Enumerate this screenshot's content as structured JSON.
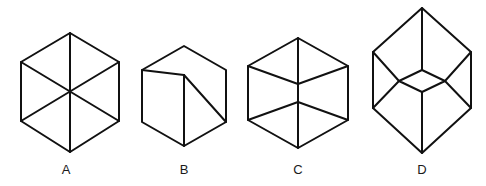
{
  "figure": {
    "type": "line-drawing-multiple-choice",
    "background_color": "#ffffff",
    "stroke_color": "#111111",
    "stroke_width": 2,
    "label_color": "#1a1a1a",
    "canvas": {
      "width": 486,
      "height": 186
    },
    "options": [
      {
        "id": "A",
        "label": "A",
        "name": "hexagon-with-three-full-diagonals",
        "label_x": 66,
        "label_y": 174,
        "outline_points": "70,33 119,62 119,121 70,152 21,121 21,62",
        "inner_lines": [
          "70,33 70,152",
          "21,62 119,121",
          "119,62 21,121"
        ],
        "center": {
          "x": 70,
          "y": 92
        }
      },
      {
        "id": "B",
        "label": "B",
        "name": "cube-inner-vertex-lower-left",
        "label_x": 184,
        "label_y": 174,
        "outline_points": "184,46 226,70 226,122 184,146 142,122 142,70",
        "inner_lines": [
          "184,75 184,146",
          "184,75 142,70",
          "184,75 226,122"
        ],
        "center": {
          "x": 184,
          "y": 96
        }
      },
      {
        "id": "C",
        "label": "C",
        "name": "hexagon-with-roof-and-floor",
        "label_x": 298,
        "label_y": 174,
        "outline_points": "298,38 348,66 348,120 298,148 248,120 248,66",
        "inner_lines": [
          "298,38 298,148",
          "248,66 298,84",
          "348,66 298,84",
          "248,120 298,102",
          "348,120 298,102"
        ],
        "center": {
          "x": 298,
          "y": 93
        }
      },
      {
        "id": "D",
        "label": "D",
        "name": "tall-hexagon-with-center-diamond",
        "label_x": 422,
        "label_y": 174,
        "outline_points": "422,8 471,52 471,108 422,153 373,108 373,52",
        "inner_lines": [
          "422,8 422,70",
          "422,92 422,153",
          "422,70 445,81",
          "445,81 422,92",
          "422,92 399,81",
          "399,81 422,70",
          "399,81 373,52",
          "399,81 373,108",
          "445,81 471,52",
          "445,81 471,108"
        ],
        "center": {
          "x": 422,
          "y": 81
        }
      }
    ]
  }
}
